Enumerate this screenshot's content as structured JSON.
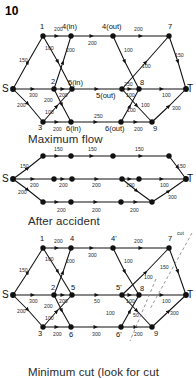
{
  "problem_number": "10",
  "captions": {
    "maximum_flow": "Maximum flow",
    "after_accident": "After accident",
    "minimum_cut": "Minimum cut (look for cut"
  },
  "colors": {
    "ink": "#111111",
    "label": "#2b2b2b",
    "caption": "#2a2a2a",
    "background": "#ffffff",
    "cut_line": "#8a8a8a"
  },
  "figure_capacities": {
    "title": "Network with capacities",
    "nodes": [
      {
        "id": "S",
        "label": "S"
      },
      {
        "id": "1",
        "label": "1"
      },
      {
        "id": "2",
        "label": "2"
      },
      {
        "id": "3",
        "label": "3"
      },
      {
        "id": "4in",
        "label": "4(in)"
      },
      {
        "id": "4out",
        "label": "4(out)"
      },
      {
        "id": "5in",
        "label": "5(in)"
      },
      {
        "id": "5out",
        "label": "5(out)"
      },
      {
        "id": "6in",
        "label": "6(in)"
      },
      {
        "id": "6out",
        "label": "6(out)"
      },
      {
        "id": "7",
        "label": "7"
      },
      {
        "id": "8",
        "label": "8"
      },
      {
        "id": "9",
        "label": "9"
      },
      {
        "id": "T",
        "label": "T"
      }
    ],
    "edges": [
      {
        "from": "S",
        "to": "1",
        "capacity": "150"
      },
      {
        "from": "S",
        "to": "2",
        "capacity": "300"
      },
      {
        "from": "S",
        "to": "3",
        "capacity": "200"
      },
      {
        "from": "1",
        "to": "4in",
        "capacity": "200"
      },
      {
        "from": "1",
        "to": "5in",
        "capacity": "100"
      },
      {
        "from": "2",
        "to": "4in",
        "capacity": "200"
      },
      {
        "from": "2",
        "to": "5in",
        "capacity": "200"
      },
      {
        "from": "2",
        "to": "6in",
        "capacity": "200"
      },
      {
        "from": "3",
        "to": "5in",
        "capacity": "100"
      },
      {
        "from": "3",
        "to": "6in",
        "capacity": "200"
      },
      {
        "from": "4in",
        "to": "4out",
        "capacity": "200"
      },
      {
        "from": "5in",
        "to": "5out",
        "capacity": "250"
      },
      {
        "from": "6in",
        "to": "6out",
        "capacity": "250"
      },
      {
        "from": "4out",
        "to": "7",
        "capacity": "200"
      },
      {
        "from": "4out",
        "to": "8",
        "capacity": "100"
      },
      {
        "from": "5out",
        "to": "7",
        "capacity": "100"
      },
      {
        "from": "5out",
        "to": "8",
        "capacity": "100"
      },
      {
        "from": "5out",
        "to": "9",
        "capacity": "100"
      },
      {
        "from": "6out",
        "to": "8",
        "capacity": "100"
      },
      {
        "from": "6out",
        "to": "9",
        "capacity": "200"
      },
      {
        "from": "7",
        "to": "T",
        "capacity": "150"
      },
      {
        "from": "8",
        "to": "T",
        "capacity": "100"
      },
      {
        "from": "9",
        "to": "T",
        "capacity": "300"
      }
    ]
  },
  "figure_maxflow": {
    "title": "Maximum flow",
    "edges": [
      {
        "from": "S",
        "to": "1",
        "flow": "150"
      },
      {
        "from": "S",
        "to": "2",
        "flow": "200"
      },
      {
        "from": "S",
        "to": "3",
        "flow": "200"
      },
      {
        "from": "1",
        "to": "4in",
        "flow": "150"
      },
      {
        "from": "4in",
        "to": "4out",
        "flow": "150"
      },
      {
        "from": "4out",
        "to": "7",
        "flow": "150"
      },
      {
        "from": "7",
        "to": "T",
        "flow": "150"
      },
      {
        "from": "2",
        "to": "5in",
        "flow": "200"
      },
      {
        "from": "5in",
        "to": "5out",
        "flow": "200"
      },
      {
        "from": "5out",
        "to": "8",
        "flow": "100"
      },
      {
        "from": "5out",
        "to": "9",
        "flow": "100"
      },
      {
        "from": "8",
        "to": "T",
        "flow": "100"
      },
      {
        "from": "3",
        "to": "6in",
        "flow": "200"
      },
      {
        "from": "6in",
        "to": "6out",
        "flow": "200"
      },
      {
        "from": "6out",
        "to": "9",
        "flow": "200"
      },
      {
        "from": "9",
        "to": "T",
        "flow": "300"
      }
    ]
  },
  "figure_accident": {
    "title": "After accident",
    "nodes": [
      {
        "id": "S",
        "label": "S"
      },
      {
        "id": "1",
        "label": "1"
      },
      {
        "id": "2",
        "label": "2"
      },
      {
        "id": "3",
        "label": "3"
      },
      {
        "id": "4",
        "label": "4"
      },
      {
        "id": "4p",
        "label": "4'"
      },
      {
        "id": "5",
        "label": "5"
      },
      {
        "id": "5p",
        "label": "5'"
      },
      {
        "id": "6",
        "label": "6"
      },
      {
        "id": "6p",
        "label": "6'"
      },
      {
        "id": "7",
        "label": "7"
      },
      {
        "id": "8",
        "label": "8"
      },
      {
        "id": "9",
        "label": "9"
      },
      {
        "id": "T",
        "label": "T"
      }
    ],
    "edges": [
      {
        "from": "S",
        "to": "1",
        "capacity": "150"
      },
      {
        "from": "S",
        "to": "2",
        "capacity": "300"
      },
      {
        "from": "S",
        "to": "3",
        "capacity": "200"
      },
      {
        "from": "1",
        "to": "4",
        "capacity": "200"
      },
      {
        "from": "1",
        "to": "5",
        "capacity": "100"
      },
      {
        "from": "2",
        "to": "4",
        "capacity": "200"
      },
      {
        "from": "2",
        "to": "5",
        "capacity": "200"
      },
      {
        "from": "2",
        "to": "6",
        "capacity": "200"
      },
      {
        "from": "3",
        "to": "5",
        "capacity": "100"
      },
      {
        "from": "3",
        "to": "6",
        "capacity": "200"
      },
      {
        "from": "4",
        "to": "4p",
        "capacity": "300"
      },
      {
        "from": "5",
        "to": "5p",
        "capacity": "50"
      },
      {
        "from": "6",
        "to": "6p",
        "capacity": "300"
      },
      {
        "from": "4p",
        "to": "7",
        "capacity": "200"
      },
      {
        "from": "4p",
        "to": "8",
        "capacity": "100"
      },
      {
        "from": "5p",
        "to": "7",
        "capacity": "100"
      },
      {
        "from": "5p",
        "to": "8",
        "capacity": "100"
      },
      {
        "from": "5p",
        "to": "9",
        "capacity": "50"
      },
      {
        "from": "6p",
        "to": "8",
        "capacity": "100"
      },
      {
        "from": "6p",
        "to": "9",
        "capacity": "200"
      },
      {
        "from": "7",
        "to": "T",
        "capacity": "150"
      },
      {
        "from": "8",
        "to": "T",
        "capacity": "100"
      },
      {
        "from": "9",
        "to": "T",
        "capacity": "300"
      }
    ],
    "cut_label": "cut"
  }
}
